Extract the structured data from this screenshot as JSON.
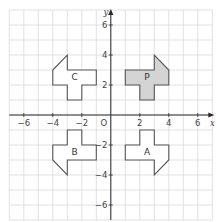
{
  "diagram": {
    "type": "coordinate-grid-transformations",
    "axes": {
      "x_label": "x",
      "y_label": "y",
      "origin_label": "O",
      "x_range": [
        -7,
        7
      ],
      "y_range": [
        -7,
        7
      ],
      "x_ticks": [
        -6,
        -4,
        -2,
        2,
        4,
        6
      ],
      "y_ticks": [
        6,
        4,
        2,
        -2,
        -4,
        -6
      ],
      "x_tick_labels": [
        "−6",
        "−4",
        "−2",
        "2",
        "4",
        "6"
      ],
      "y_tick_labels": [
        "6",
        "4",
        "2",
        "−2",
        "−4",
        "−6"
      ]
    },
    "grid": {
      "step": 1,
      "color": "#d9d9d9"
    },
    "colors": {
      "axis": "#2a2a2a",
      "outline": "#555555",
      "shaded_fill": "#d4d4d4",
      "unshaded_fill": "#ffffff",
      "label": "#333333"
    },
    "shapes": [
      {
        "label": "P",
        "shaded": true,
        "label_pos": [
          2.5,
          2.6
        ],
        "vertices": [
          [
            1,
            2
          ],
          [
            1,
            3
          ],
          [
            3,
            3
          ],
          [
            3,
            4
          ],
          [
            4,
            3
          ],
          [
            4,
            2
          ],
          [
            3,
            2
          ],
          [
            3,
            1
          ],
          [
            2,
            1
          ],
          [
            2,
            2
          ]
        ]
      },
      {
        "label": "C",
        "shaded": false,
        "label_pos": [
          -2.5,
          2.6
        ],
        "vertices": [
          [
            -1,
            2
          ],
          [
            -1,
            3
          ],
          [
            -3,
            3
          ],
          [
            -3,
            4
          ],
          [
            -4,
            3
          ],
          [
            -4,
            2
          ],
          [
            -3,
            2
          ],
          [
            -3,
            1
          ],
          [
            -2,
            1
          ],
          [
            -2,
            2
          ]
        ]
      },
      {
        "label": "B",
        "shaded": false,
        "label_pos": [
          -2.5,
          -2.4
        ],
        "vertices": [
          [
            -1,
            -2
          ],
          [
            -1,
            -3
          ],
          [
            -3,
            -3
          ],
          [
            -3,
            -4
          ],
          [
            -4,
            -3
          ],
          [
            -4,
            -2
          ],
          [
            -3,
            -2
          ],
          [
            -3,
            -1
          ],
          [
            -2,
            -1
          ],
          [
            -2,
            -2
          ]
        ]
      },
      {
        "label": "A",
        "shaded": false,
        "label_pos": [
          2.5,
          -2.4
        ],
        "vertices": [
          [
            1,
            -2
          ],
          [
            1,
            -3
          ],
          [
            3,
            -3
          ],
          [
            3,
            -4
          ],
          [
            4,
            -3
          ],
          [
            4,
            -2
          ],
          [
            3,
            -2
          ],
          [
            3,
            -1
          ],
          [
            2,
            -1
          ],
          [
            2,
            -2
          ]
        ]
      }
    ]
  }
}
